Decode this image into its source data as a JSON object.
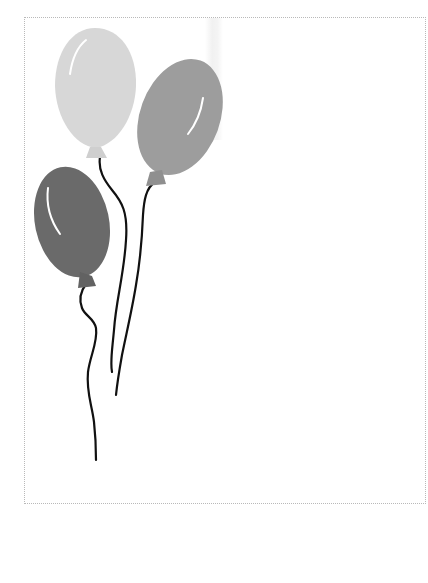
{
  "page": {
    "background": "#ffffff",
    "frame": {
      "border_color": "#b9b9b9",
      "style": "dotted"
    }
  },
  "balloons": [
    {
      "name": "light-balloon",
      "color": "#d7d7d7",
      "knot_color": "#cfcfcf",
      "highlight": "#ffffff"
    },
    {
      "name": "mid-balloon",
      "color": "#9d9d9d",
      "knot_color": "#8f8f8f",
      "highlight": "#ffffff"
    },
    {
      "name": "dark-balloon",
      "color": "#6a6a6a",
      "knot_color": "#626262",
      "highlight": "#ffffff"
    }
  ],
  "string_color": "#111111"
}
